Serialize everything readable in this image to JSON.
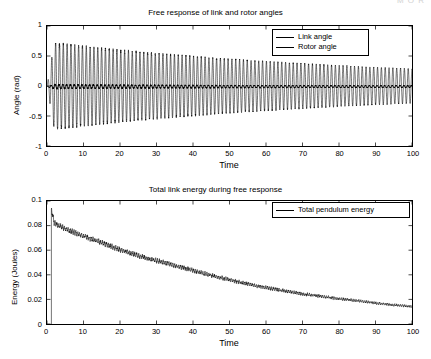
{
  "watermark": {
    "text": "M  O  R"
  },
  "figure": {
    "background_color": "#ffffff",
    "line_color": "#000000"
  },
  "panels": [
    {
      "id": "angle-panel",
      "title": "Free response of link and rotor angles",
      "xlabel": "Time",
      "ylabel": "Angle (rad)",
      "xticks": [
        "0",
        "10",
        "20",
        "30",
        "40",
        "50",
        "60",
        "70",
        "80",
        "90",
        "100"
      ],
      "yticks": [
        "1",
        "0.5",
        "0",
        "-0.5",
        "-1"
      ],
      "legend": [
        {
          "label": "Link angle",
          "style": "thin"
        },
        {
          "label": "Rotor angle",
          "style": "thin"
        }
      ]
    },
    {
      "id": "energy-panel",
      "title": "Total link energy during free response",
      "xlabel": "Time",
      "ylabel": "Energy (Joules)",
      "xticks": [
        "0",
        "10",
        "20",
        "30",
        "40",
        "50",
        "60",
        "70",
        "80",
        "90",
        "100"
      ],
      "yticks": [
        "0.1",
        "0.08",
        "0.06",
        "0.04",
        "0.02",
        "0"
      ],
      "legend": [
        {
          "label": "Total pendulum energy",
          "style": "thin"
        }
      ]
    }
  ],
  "chart_data": [
    {
      "type": "line",
      "id": "angle-panel",
      "title": "Free response of link and rotor angles",
      "xlabel": "Time",
      "ylabel": "Angle (rad)",
      "xlim": [
        0,
        100
      ],
      "ylim": [
        -1,
        1
      ],
      "xtick_values": [
        0,
        10,
        20,
        30,
        40,
        50,
        60,
        70,
        80,
        90,
        100
      ],
      "ytick_values": [
        -1,
        -0.5,
        0,
        0.5,
        1
      ],
      "grid": false,
      "legend_position": "upper right",
      "series": [
        {
          "name": "Link angle",
          "description": "Lightly damped sinusoidal oscillation about zero; envelope decays roughly exponentially.",
          "oscillation_period": 1.05,
          "envelope_x": [
            0,
            2,
            5,
            10,
            20,
            30,
            40,
            50,
            60,
            70,
            80,
            90,
            100
          ],
          "envelope_amplitude": [
            0.0,
            0.72,
            0.7,
            0.665,
            0.6,
            0.545,
            0.495,
            0.45,
            0.41,
            0.375,
            0.34,
            0.31,
            0.285
          ],
          "mean_value": 0.0
        },
        {
          "name": "Rotor angle",
          "description": "Very small amplitude ripple, appears as a near-flat dark line at zero.",
          "envelope_x": [
            0,
            2,
            10,
            50,
            100
          ],
          "envelope_amplitude": [
            0.0,
            0.035,
            0.03,
            0.022,
            0.016
          ],
          "mean_value": -0.01
        }
      ]
    },
    {
      "type": "line",
      "id": "energy-panel",
      "title": "Total link energy during free response",
      "xlabel": "Time",
      "ylabel": "Energy (Joules)",
      "xlim": [
        0,
        100
      ],
      "ylim": [
        0,
        0.1
      ],
      "xtick_values": [
        0,
        10,
        20,
        30,
        40,
        50,
        60,
        70,
        80,
        90,
        100
      ],
      "ytick_values": [
        0,
        0.02,
        0.04,
        0.06,
        0.08,
        0.1
      ],
      "grid": false,
      "legend_position": "upper right",
      "series": [
        {
          "name": "Total pendulum energy",
          "description": "Initial spike then monotonic decay with fast small-amplitude ripple superposed.",
          "x": [
            1.2,
            2,
            5,
            10,
            15,
            20,
            25,
            30,
            35,
            40,
            45,
            50,
            55,
            60,
            65,
            70,
            75,
            80,
            85,
            90,
            95,
            100
          ],
          "y": [
            0.093,
            0.082,
            0.0775,
            0.0715,
            0.066,
            0.0605,
            0.0555,
            0.0515,
            0.0475,
            0.0435,
            0.0395,
            0.036,
            0.0325,
            0.0295,
            0.027,
            0.0245,
            0.0225,
            0.0205,
            0.019,
            0.017,
            0.0155,
            0.0142
          ],
          "ripple_amplitude": 0.0028,
          "ripple_decay": 0.6
        }
      ]
    }
  ]
}
